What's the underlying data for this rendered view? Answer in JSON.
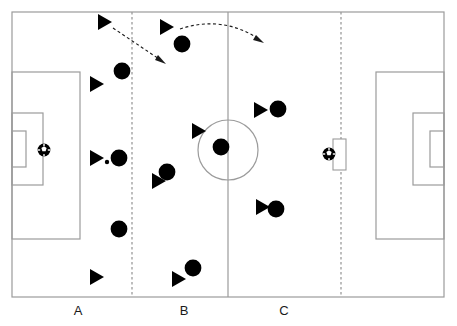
{
  "diagram": {
    "type": "soccer-tactical-diagram",
    "canvas": {
      "width": 457,
      "height": 326
    },
    "colors": {
      "background": "#ffffff",
      "line": "#9b9b9b",
      "dashed_line": "#9b9b9b",
      "marker_fill": "#000000",
      "arrow": "#1a1a1a",
      "label_text": "#1a1a1a"
    }
  },
  "pitch": {
    "boundary": {
      "x": 12,
      "y": 12,
      "width": 432,
      "height": 285
    },
    "halfway_line_x": 228,
    "center_circle": {
      "cx": 228,
      "cy": 150,
      "r": 30
    },
    "left_penalty_area": {
      "x": 12,
      "y": 72,
      "width": 68,
      "height": 167
    },
    "left_goal_area": {
      "x": 12,
      "y": 113,
      "width": 31,
      "height": 72
    },
    "left_goal": {
      "x": 12,
      "y": 131,
      "width": 14,
      "height": 36
    },
    "right_penalty_area": {
      "x": 376,
      "y": 72,
      "width": 68,
      "height": 167
    },
    "right_goal_area": {
      "x": 413,
      "y": 113,
      "width": 31,
      "height": 72
    },
    "right_goal": {
      "x": 430,
      "y": 131,
      "width": 14,
      "height": 36
    }
  },
  "zone_dividers": [
    {
      "name": "divider-a-b",
      "x": 132
    },
    {
      "name": "divider-b-c",
      "x": 341
    }
  ],
  "zone_labels": [
    {
      "id": "A",
      "label": "A",
      "x": 78,
      "y": 303
    },
    {
      "id": "B",
      "label": "B",
      "x": 184,
      "y": 303
    },
    {
      "id": "C",
      "label": "C",
      "x": 284,
      "y": 303
    }
  ],
  "markers": {
    "triangles": [
      {
        "id": "t1",
        "x": 104,
        "y": 22
      },
      {
        "id": "t2",
        "x": 166,
        "y": 27
      },
      {
        "id": "t3",
        "x": 96,
        "y": 84
      },
      {
        "id": "t4",
        "x": 96,
        "y": 158
      },
      {
        "id": "t5",
        "x": 198,
        "y": 131
      },
      {
        "id": "t6",
        "x": 260,
        "y": 110
      },
      {
        "id": "t7",
        "x": 158,
        "y": 181
      },
      {
        "id": "t8",
        "x": 262,
        "y": 207
      },
      {
        "id": "t9",
        "x": 96,
        "y": 277
      },
      {
        "id": "t10",
        "x": 178,
        "y": 279
      }
    ],
    "circles": [
      {
        "id": "c1",
        "x": 182,
        "y": 44
      },
      {
        "id": "c2",
        "x": 122,
        "y": 71
      },
      {
        "id": "c3",
        "x": 278,
        "y": 109
      },
      {
        "id": "c4",
        "x": 221,
        "y": 147
      },
      {
        "id": "c5",
        "x": 119,
        "y": 158
      },
      {
        "id": "c6",
        "x": 167,
        "y": 172
      },
      {
        "id": "c7",
        "x": 276,
        "y": 209
      },
      {
        "id": "c8",
        "x": 119,
        "y": 229
      },
      {
        "id": "c9",
        "x": 193,
        "y": 268
      }
    ],
    "small_dots": [
      {
        "id": "d1",
        "x": 107,
        "y": 162,
        "r": 2.2
      }
    ],
    "balls": [
      {
        "id": "ball-left",
        "x": 44,
        "y": 150
      },
      {
        "id": "ball-right",
        "x": 329,
        "y": 154
      }
    ],
    "mini_goal": {
      "x": 333,
      "y": 139,
      "width": 13,
      "height": 31
    }
  },
  "arrows": [
    {
      "id": "arrow-diagonal",
      "style": "dashed",
      "path": "M 113 28 L 163 62",
      "head": {
        "x": 163,
        "y": 62,
        "angle": 34
      }
    },
    {
      "id": "arrow-curved",
      "style": "dashed",
      "path": "M 180 29 Q 222 16 262 41",
      "head": {
        "x": 262,
        "y": 41,
        "angle": 38
      }
    }
  ]
}
